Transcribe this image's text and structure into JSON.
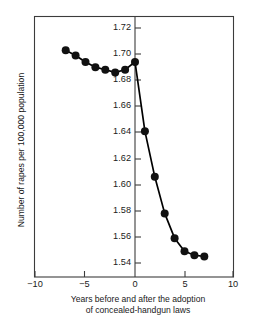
{
  "chart_data": {
    "type": "line",
    "title": "",
    "subtitle": "",
    "xlabel_line1": "Years before and after the adoption",
    "xlabel_line2": "of concealed-handgun laws",
    "ylabel": "Number of rapes per 100,000 population",
    "xlim": [
      -10,
      10
    ],
    "ylim": [
      1.53,
      1.73
    ],
    "grid": false,
    "legend": "none",
    "x_ticks": [
      -10,
      -5,
      0,
      5,
      10
    ],
    "x_tick_labels": [
      "−10",
      "−5",
      "0",
      "5",
      "10"
    ],
    "y_ticks": [
      1.54,
      1.56,
      1.58,
      1.6,
      1.62,
      1.64,
      1.66,
      1.68,
      1.7,
      1.72
    ],
    "y_tick_labels": [
      "1.54",
      "1.56",
      "1.58",
      "1.60",
      "1.62",
      "1.64",
      "1.66",
      "1.68",
      "1.70",
      "1.72"
    ],
    "marker": "filled-circle",
    "marker_color": "#111111",
    "line_color": "#000000",
    "x": [
      -7,
      -6,
      -5,
      -4,
      -3,
      -2,
      -1,
      0,
      1,
      2,
      3,
      4,
      5,
      6,
      7
    ],
    "series": [
      {
        "name": "Rapes per 100,000 population",
        "values": [
          1.703,
          1.699,
          1.694,
          1.69,
          1.688,
          1.686,
          1.688,
          1.694,
          1.641,
          1.606,
          1.578,
          1.559,
          1.549,
          1.546,
          1.545
        ]
      }
    ]
  },
  "figure": {
    "background_color": "#ffffff",
    "axis_color": "#3c3c3c"
  }
}
